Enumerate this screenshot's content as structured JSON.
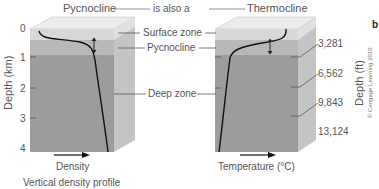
{
  "header": {
    "left_label": "Pycnocline",
    "connector_text": "is also a",
    "right_label": "Thermocline"
  },
  "zones": {
    "surface": "Surface zone",
    "pycnocline": "Pycnocline",
    "deep": "Deep zone"
  },
  "left_axis": {
    "title": "Depth (km)",
    "ticks": [
      "0",
      "1",
      "2",
      "3",
      "4"
    ]
  },
  "right_axis": {
    "title": "Depth (ft)",
    "ticks": [
      "3,281",
      "6,562",
      "9,843",
      "13,124"
    ]
  },
  "left_panel": {
    "x_label": "Density",
    "caption": "Vertical density profile"
  },
  "right_panel": {
    "x_label": "Temperature (°C)"
  },
  "panel_letter": "b",
  "credit": "© Cengage Learning 2010",
  "colors": {
    "surface": "#d6d6d6",
    "pycnocline": "#b4b4b4",
    "deep": "#9b9b9b",
    "side": "#c2c2c2",
    "top": "#e9e9e9",
    "curve": "#111111",
    "text": "#555555"
  }
}
